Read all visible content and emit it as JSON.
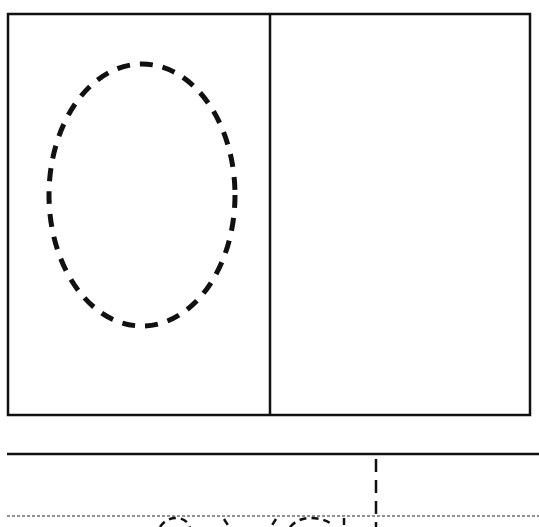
{
  "worksheet": {
    "drawing_box": {
      "x": 8,
      "y": 14,
      "width": 522,
      "height": 401,
      "divider_x": 270,
      "stroke": "#111111"
    },
    "left_panel": {
      "shape": "dashed-oval",
      "cx": 142,
      "cy": 195,
      "rx": 93,
      "ry": 131
    },
    "right_panel": {
      "content": "empty"
    },
    "writing_lines": {
      "top_line_y": 454,
      "mid_dotted_y": 516,
      "dashed_vertical_x": 376,
      "partial_traced_letters_visible": true
    },
    "colors": {
      "ink": "#111111",
      "paper": "#ffffff"
    }
  }
}
